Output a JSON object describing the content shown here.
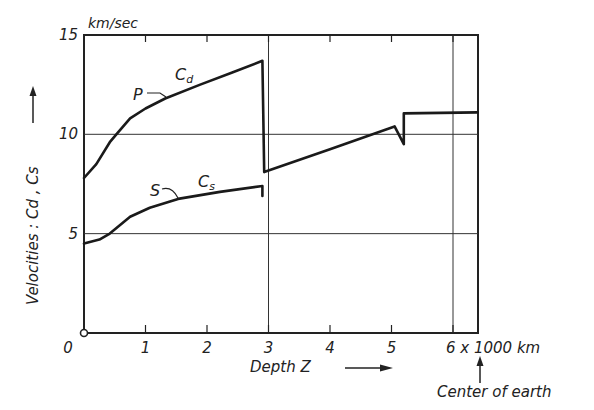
{
  "chart_data": {
    "type": "line",
    "title": "",
    "xlabel": "Depth Z",
    "ylabel": "Velocities : Cd , Cs",
    "y_unit": "km/sec",
    "x_unit_label": "6 x 1000 km",
    "x_annotation": "Center of earth",
    "xlim": [
      0,
      6.4
    ],
    "ylim": [
      0,
      15
    ],
    "x_ticks": [
      "0",
      "1",
      "2",
      "3",
      "4",
      "5",
      "6 x 1000 km"
    ],
    "x_tick_values": [
      0,
      1,
      2,
      3,
      4,
      5,
      6
    ],
    "y_ticks": [
      "0",
      "5",
      "10",
      "15"
    ],
    "y_tick_values": [
      0,
      5,
      10,
      15
    ],
    "grid": {
      "horizontal": [
        5,
        10
      ],
      "vertical": [
        3,
        6
      ]
    },
    "series": [
      {
        "name": "Cd",
        "label": "P",
        "points": [
          [
            0,
            7.8
          ],
          [
            0.2,
            8.5
          ],
          [
            0.42,
            9.6
          ],
          [
            0.54,
            10.05
          ],
          [
            0.75,
            10.8
          ],
          [
            1.0,
            11.3
          ],
          [
            1.32,
            11.8
          ],
          [
            1.89,
            12.5
          ],
          [
            2.4,
            13.1
          ],
          [
            2.9,
            13.7
          ],
          [
            2.93,
            8.1
          ],
          [
            4.0,
            9.25
          ],
          [
            5.05,
            10.4
          ],
          [
            5.2,
            9.5
          ],
          [
            5.2,
            11.05
          ],
          [
            6.4,
            11.1
          ]
        ]
      },
      {
        "name": "Cs",
        "label": "S",
        "points": [
          [
            0,
            4.5
          ],
          [
            0.25,
            4.7
          ],
          [
            0.42,
            5.0
          ],
          [
            0.75,
            5.85
          ],
          [
            1.07,
            6.3
          ],
          [
            1.53,
            6.75
          ],
          [
            2.21,
            7.1
          ],
          [
            2.9,
            7.4
          ],
          [
            2.9,
            6.9
          ]
        ]
      }
    ]
  },
  "labels": {
    "y_unit": "km/sec",
    "y_axis_title": "Velocities :  Cd , Cs",
    "x_axis_title": "Depth  Z",
    "x_last_tick": "6 x 1000 km",
    "center_note": "Center of earth",
    "p_label": "P",
    "s_label": "S",
    "cd_main": "C",
    "cd_sub": "d",
    "cs_main": "C",
    "cs_sub": "s"
  }
}
